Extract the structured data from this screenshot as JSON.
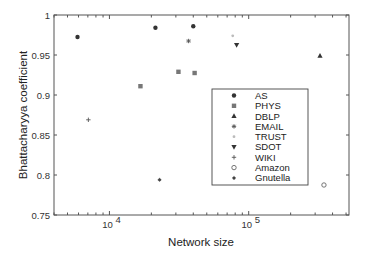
{
  "chart_data": {
    "type": "scatter",
    "title": "",
    "xlabel": "Network size",
    "ylabel": "Bhattacharyya coefficient",
    "xscale": "log",
    "xlim": [
      4000,
      525000
    ],
    "ylim": [
      0.75,
      1.0
    ],
    "xticks": [
      {
        "value": 10000,
        "base": "10",
        "exp": "4"
      },
      {
        "value": 100000,
        "base": "10",
        "exp": "5"
      }
    ],
    "yticks": [
      0.75,
      0.8,
      0.85,
      0.9,
      0.95,
      1
    ],
    "ytick_labels": [
      "0.75",
      "0.8",
      "0.85",
      "0.9",
      "0.95",
      "1"
    ],
    "grid": false,
    "legend_position": "inside-right-middle",
    "series": [
      {
        "name": "AS",
        "marker": "filled-circle",
        "color": "#333333",
        "points": [
          [
            5900,
            0.9725
          ],
          [
            21400,
            0.984
          ],
          [
            40000,
            0.986
          ]
        ]
      },
      {
        "name": "PHYS",
        "marker": "filled-square",
        "color": "#777777",
        "points": [
          [
            16700,
            0.911
          ],
          [
            31300,
            0.929
          ],
          [
            40900,
            0.9275
          ]
        ]
      },
      {
        "name": "DBLP",
        "marker": "triangle-up",
        "color": "#333333",
        "points": [
          [
            325000,
            0.949
          ]
        ]
      },
      {
        "name": "EMAIL",
        "marker": "asterisk",
        "color": "#555555",
        "points": [
          [
            37000,
            0.9675
          ]
        ]
      },
      {
        "name": "TRUST",
        "marker": "point",
        "color": "#bbbbbb",
        "points": [
          [
            76800,
            0.974
          ]
        ]
      },
      {
        "name": "SDOT",
        "marker": "triangle-down",
        "color": "#333333",
        "points": [
          [
            81900,
            0.9625
          ]
        ]
      },
      {
        "name": "WIKI",
        "marker": "plus",
        "color": "#555555",
        "points": [
          [
            7060,
            0.869
          ]
        ]
      },
      {
        "name": "Amazon",
        "marker": "open-circle",
        "color": "#666666",
        "points": [
          [
            347000,
            0.7875
          ]
        ]
      },
      {
        "name": "Gnutella",
        "marker": "star",
        "color": "#444444",
        "points": [
          [
            22900,
            0.794
          ]
        ]
      }
    ]
  }
}
